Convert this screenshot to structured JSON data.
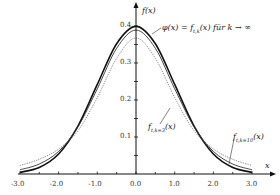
{
  "chart_data": {
    "type": "line",
    "title": "",
    "xlabel": "x",
    "ylabel": "f(x)",
    "xlim": [
      -3.0,
      3.0
    ],
    "ylim": [
      0,
      0.42
    ],
    "x_ticks": [
      "-3.0",
      "-2.0",
      "-1.0",
      "0.0",
      "1.0",
      "2.0",
      "3.0"
    ],
    "y_ticks": [
      "0.1",
      "0.2",
      "0.3",
      "0.4"
    ],
    "grid": false,
    "x": [
      -3.0,
      -2.5,
      -2.0,
      -1.5,
      -1.0,
      -0.5,
      0.0,
      0.5,
      1.0,
      1.5,
      2.0,
      2.5,
      3.0
    ],
    "series": [
      {
        "name": "φ(x) = f_{t,k}(x) für k → ∞",
        "style": "solid-thick",
        "values": [
          0.0044,
          0.0175,
          0.054,
          0.1295,
          0.242,
          0.3521,
          0.3989,
          0.3521,
          0.242,
          0.1295,
          0.054,
          0.0175,
          0.0044
        ]
      },
      {
        "name": "f_{t,k=10}(x)",
        "style": "solid",
        "values": [
          0.0114,
          0.0269,
          0.0611,
          0.1274,
          0.2304,
          0.3397,
          0.3891,
          0.3397,
          0.2304,
          0.1274,
          0.0611,
          0.0269,
          0.0114
        ]
      },
      {
        "name": "f_{t,k=3}(x)",
        "style": "dotted",
        "values": [
          0.0229,
          0.0398,
          0.0675,
          0.1169,
          0.2067,
          0.3125,
          0.3676,
          0.3125,
          0.2067,
          0.1169,
          0.0675,
          0.0398,
          0.0229
        ]
      }
    ],
    "annotations": [
      {
        "text": "φ(x) = f_{t,k}(x) für k → ∞",
        "target": "normal"
      },
      {
        "text": "f_{t,k=3}(x)",
        "target": "t3"
      },
      {
        "text": "f_{t,k=10}(x)",
        "target": "t10"
      }
    ]
  },
  "labels": {
    "ylabel": "f(x)",
    "xlabel": "x",
    "phi": "φ(x) = f",
    "phi_sub": "t,k",
    "phi_rest": "(x) für k → ∞",
    "t3": "f",
    "t3_sub": "t,k=3",
    "t3_rest": "(x)",
    "t10": "f",
    "t10_sub": "t,k=10",
    "t10_rest": "(x)"
  }
}
